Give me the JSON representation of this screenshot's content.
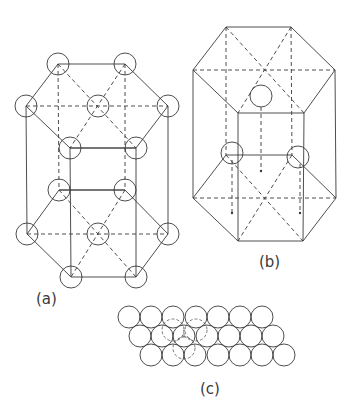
{
  "figure": {
    "panels": [
      {
        "id": "a",
        "label": "(a)",
        "description": "Hexagonal close-packed unit cell with atoms at hexagon vertices and centers"
      },
      {
        "id": "b",
        "label": "(b)",
        "description": "Hexagonal prism with three interior atoms"
      },
      {
        "id": "c",
        "label": "(c)",
        "description": "Close-packed layer of spheres with dashed overlay of next layer"
      }
    ]
  },
  "labels": {
    "a": "(a)",
    "b": "(b)",
    "c": "(c)"
  }
}
